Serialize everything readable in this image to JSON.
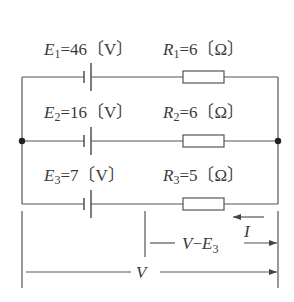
{
  "diagram": {
    "type": "circuit",
    "branches": [
      {
        "source": {
          "symbol": "E",
          "index": "1",
          "value": "46",
          "unit": "〔V〕"
        },
        "resistor": {
          "symbol": "R",
          "index": "1",
          "value": "6",
          "unit": "〔Ω〕"
        }
      },
      {
        "source": {
          "symbol": "E",
          "index": "2",
          "value": "16",
          "unit": "〔V〕"
        },
        "resistor": {
          "symbol": "R",
          "index": "2",
          "value": "6",
          "unit": "〔Ω〕"
        }
      },
      {
        "source": {
          "symbol": "E",
          "index": "3",
          "value": "7",
          "unit": "〔V〕"
        },
        "resistor": {
          "symbol": "R",
          "index": "3",
          "value": "5",
          "unit": "〔Ω〕"
        }
      }
    ],
    "annotations": {
      "current": "I",
      "voltage_difference": {
        "v": "V",
        "minus": "−",
        "e": "E",
        "index": "3"
      },
      "voltage": "V"
    },
    "colors": {
      "line": "#555555",
      "text": "#3a3a3a",
      "background": "#ffffff"
    }
  }
}
